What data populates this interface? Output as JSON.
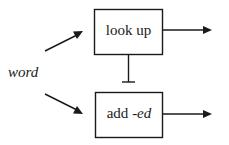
{
  "diagram": {
    "input": {
      "label": "word"
    },
    "nodes": [
      {
        "id": "look-up",
        "label": "look up"
      },
      {
        "id": "add-ed",
        "label_prefix": "add ",
        "label_suffix": "-ed"
      }
    ],
    "edges": [
      {
        "from": "word",
        "to": "look-up",
        "type": "arrow"
      },
      {
        "from": "word",
        "to": "add-ed",
        "type": "arrow"
      },
      {
        "from": "look-up",
        "to": "add-ed",
        "type": "inhibit"
      },
      {
        "from": "look-up",
        "to": "output",
        "type": "arrow"
      },
      {
        "from": "add-ed",
        "to": "output",
        "type": "arrow"
      }
    ],
    "colors": {
      "stroke": "#1a1a1a",
      "background": "#ffffff"
    }
  }
}
